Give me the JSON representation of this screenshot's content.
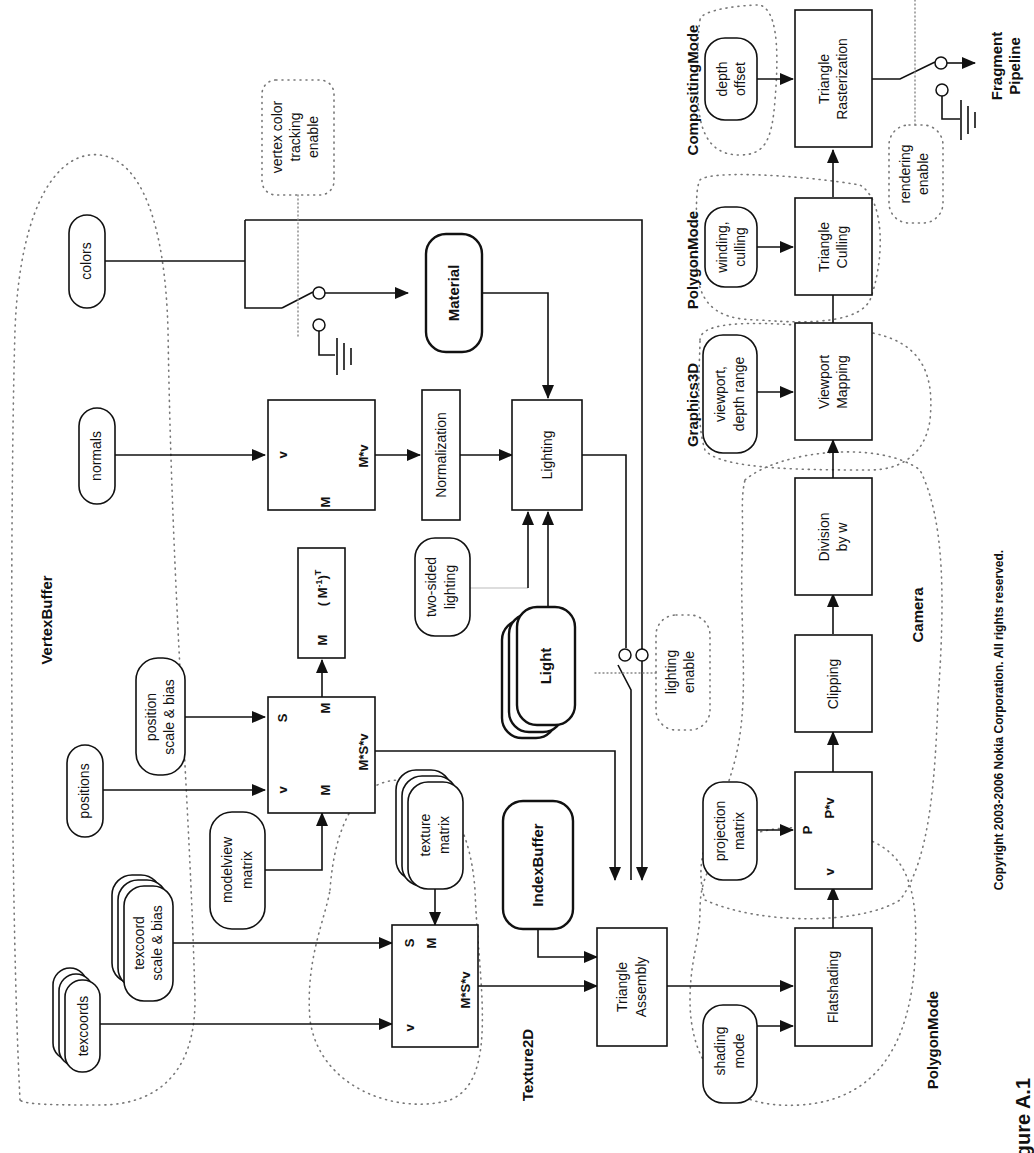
{
  "figure": {
    "caption": "Figure A.1",
    "copyright": "Copyright 2003-2006 Nokia Corporation. All rights reserved.",
    "orientation": "rotated 90deg counter-clockwise"
  },
  "groups": {
    "vertex_buffer": "VertexBuffer",
    "texture2d": "Texture2D",
    "polygon_mode_shading": "PolygonMode",
    "camera": "Camera",
    "graphics3d": "Graphics3D",
    "polygon_mode_culling": "PolygonMode",
    "compositing_mode": "CompositingMode"
  },
  "inputs": {
    "colors": "colors",
    "normals": "normals",
    "positions": "positions",
    "position_scale_bias": [
      "position",
      "scale & bias"
    ],
    "texcoords": "texcoords",
    "texcoord_scale_bias": [
      "texcoord",
      "scale & bias"
    ],
    "modelview_matrix": [
      "modelview",
      "matrix"
    ],
    "texture_matrix": [
      "texture",
      "matrix"
    ],
    "index_buffer": "IndexBuffer",
    "material": "Material",
    "light": "Light",
    "two_sided_lighting": [
      "two-sided",
      "lighting"
    ],
    "shading_mode": [
      "shading",
      "mode"
    ],
    "projection_matrix": [
      "projection",
      "matrix"
    ],
    "viewport_depth_range": [
      "viewport,",
      "depth range"
    ],
    "winding_culling": [
      "winding,",
      "culling"
    ],
    "depth_offset": [
      "depth",
      "offset"
    ]
  },
  "switches": {
    "vertex_color_tracking": [
      "vertex color",
      "tracking",
      "enable"
    ],
    "lighting_enable": [
      "lighting",
      "enable"
    ],
    "rendering_enable": [
      "rendering",
      "enable"
    ]
  },
  "stages": {
    "position_transform": {
      "v": "v",
      "m1": "M",
      "s": "S",
      "m2": "M",
      "out": "M*S*v"
    },
    "inverse_transpose": {
      "m": "M",
      "expr": "( M",
      "sup1": "-1",
      "close": ")",
      "sup2": "T"
    },
    "normal_transform": {
      "v": "v",
      "m": "M",
      "out": "M*v"
    },
    "normalization": "Normalization",
    "lighting": "Lighting",
    "texture_transform": {
      "v": "v",
      "s": "S",
      "m": "M",
      "out": "M*S*v"
    },
    "triangle_assembly": [
      "Triangle",
      "Assembly"
    ],
    "flatshading": "Flatshading",
    "projection": {
      "v": "v",
      "p": "P",
      "out": "P*v"
    },
    "clipping": "Clipping",
    "division_by_w": [
      "Division",
      "by w"
    ],
    "viewport_mapping": [
      "Viewport",
      "Mapping"
    ],
    "triangle_culling": [
      "Triangle",
      "Culling"
    ],
    "triangle_rasterization": [
      "Triangle",
      "Rasterization"
    ]
  },
  "output": [
    "Fragment",
    "Pipeline"
  ]
}
